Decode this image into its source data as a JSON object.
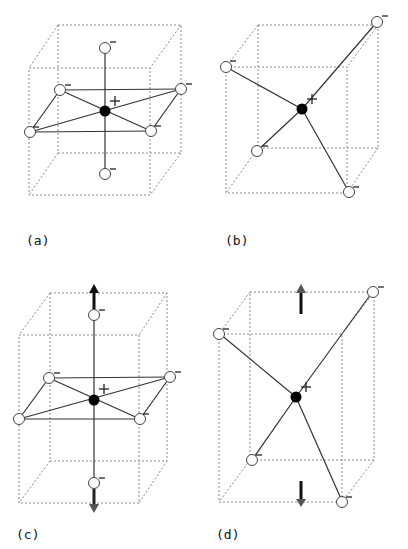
{
  "figure": {
    "panels": [
      {
        "id": "a",
        "label": "(a)",
        "description": "Octahedral coordination: central cation with six anions inside a cube",
        "cation_sign": "+",
        "anion_sign": "−"
      },
      {
        "id": "b",
        "label": "(b)",
        "description": "Tetrahedral coordination: central cation with four anions at cube corners",
        "cation_sign": "+",
        "anion_sign": "−"
      },
      {
        "id": "c",
        "label": "(c)",
        "description": "Tetragonally elongated octahedron with axial displacement arrows",
        "cation_sign": "+",
        "anion_sign": "−"
      },
      {
        "id": "d",
        "label": "(d)",
        "description": "Elongated tetrahedron with vertical displacement arrows",
        "cation_sign": "+",
        "anion_sign": "−"
      }
    ]
  }
}
